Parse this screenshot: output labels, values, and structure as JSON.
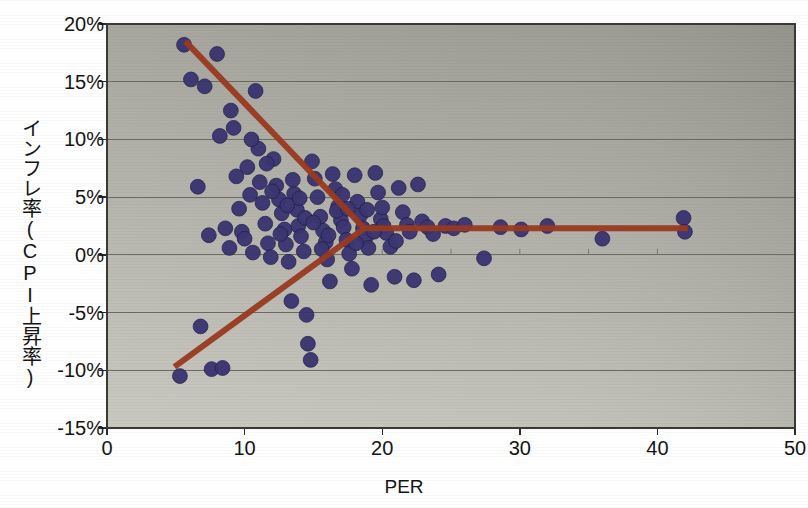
{
  "chart_data": {
    "type": "scatter",
    "title": "",
    "xlabel": "PER",
    "ylabel": "インフレ率(CPI上昇率)",
    "xlim": [
      0,
      50
    ],
    "ylim": [
      -15,
      20
    ],
    "xticks": [
      "0",
      "10",
      "20",
      "30",
      "40",
      "50"
    ],
    "xtick_values": [
      0,
      10,
      20,
      30,
      40,
      50
    ],
    "yticks": [
      "20%",
      "15%",
      "10%",
      "5%",
      "0%",
      "-5%",
      "-10%",
      "-15%"
    ],
    "ytick_values": [
      20,
      15,
      10,
      5,
      0,
      -5,
      -10,
      -15
    ],
    "grid": "horizontal",
    "legend": "none",
    "marker_color": "#3b3572",
    "trendline_color": "#9b3a20",
    "plot_background": "#aeaea6",
    "points": [
      [
        5.3,
        -10.5
      ],
      [
        5.6,
        18.2
      ],
      [
        6.1,
        15.2
      ],
      [
        6.6,
        5.9
      ],
      [
        6.8,
        -6.2
      ],
      [
        7.1,
        14.6
      ],
      [
        7.4,
        1.7
      ],
      [
        7.6,
        -9.9
      ],
      [
        8.0,
        17.4
      ],
      [
        8.2,
        10.3
      ],
      [
        8.4,
        -9.8
      ],
      [
        8.6,
        2.3
      ],
      [
        8.9,
        0.6
      ],
      [
        9.2,
        11.0
      ],
      [
        9.4,
        6.8
      ],
      [
        9.6,
        4.0
      ],
      [
        9.8,
        2.0
      ],
      [
        10.0,
        1.4
      ],
      [
        10.2,
        7.6
      ],
      [
        10.4,
        5.2
      ],
      [
        10.6,
        0.2
      ],
      [
        10.8,
        14.2
      ],
      [
        11.0,
        9.2
      ],
      [
        11.1,
        6.3
      ],
      [
        11.3,
        4.5
      ],
      [
        11.5,
        2.7
      ],
      [
        11.7,
        1.0
      ],
      [
        11.9,
        -0.2
      ],
      [
        12.1,
        8.3
      ],
      [
        12.3,
        6.0
      ],
      [
        12.5,
        4.8
      ],
      [
        12.7,
        3.6
      ],
      [
        12.9,
        2.2
      ],
      [
        13.0,
        0.9
      ],
      [
        13.2,
        -0.6
      ],
      [
        13.4,
        -4.0
      ],
      [
        13.6,
        5.3
      ],
      [
        13.8,
        3.9
      ],
      [
        13.9,
        2.5
      ],
      [
        14.1,
        1.6
      ],
      [
        14.3,
        0.3
      ],
      [
        14.5,
        -5.2
      ],
      [
        14.6,
        -7.7
      ],
      [
        14.8,
        -9.1
      ],
      [
        14.9,
        8.1
      ],
      [
        15.1,
        6.6
      ],
      [
        15.3,
        5.0
      ],
      [
        15.5,
        3.3
      ],
      [
        15.7,
        2.1
      ],
      [
        15.9,
        1.1
      ],
      [
        16.0,
        -0.4
      ],
      [
        16.2,
        -2.3
      ],
      [
        16.4,
        7.0
      ],
      [
        16.6,
        5.7
      ],
      [
        16.8,
        4.2
      ],
      [
        17.0,
        3.0
      ],
      [
        17.2,
        2.4
      ],
      [
        17.4,
        1.3
      ],
      [
        17.6,
        0.1
      ],
      [
        17.8,
        -1.2
      ],
      [
        18.0,
        6.9
      ],
      [
        18.2,
        4.6
      ],
      [
        18.4,
        3.4
      ],
      [
        18.6,
        2.3
      ],
      [
        18.8,
        1.5
      ],
      [
        19.0,
        0.6
      ],
      [
        19.2,
        -2.6
      ],
      [
        19.5,
        7.1
      ],
      [
        19.7,
        5.4
      ],
      [
        19.9,
        3.1
      ],
      [
        20.1,
        2.5
      ],
      [
        20.3,
        1.9
      ],
      [
        20.6,
        0.7
      ],
      [
        20.9,
        -1.9
      ],
      [
        21.2,
        5.8
      ],
      [
        21.5,
        3.7
      ],
      [
        21.8,
        2.6
      ],
      [
        22.0,
        2.0
      ],
      [
        22.3,
        -2.2
      ],
      [
        22.6,
        6.1
      ],
      [
        22.9,
        2.9
      ],
      [
        23.3,
        2.4
      ],
      [
        23.7,
        1.8
      ],
      [
        24.1,
        -1.7
      ],
      [
        24.6,
        2.5
      ],
      [
        25.2,
        2.3
      ],
      [
        26.0,
        2.6
      ],
      [
        27.4,
        -0.3
      ],
      [
        28.6,
        2.4
      ],
      [
        30.1,
        2.2
      ],
      [
        32.0,
        2.5
      ],
      [
        36.0,
        1.4
      ],
      [
        41.9,
        3.2
      ],
      [
        42.0,
        2.0
      ],
      [
        9.0,
        12.5
      ],
      [
        10.5,
        10.0
      ],
      [
        11.6,
        7.9
      ],
      [
        12.0,
        5.5
      ],
      [
        12.6,
        1.8
      ],
      [
        13.1,
        4.3
      ],
      [
        13.5,
        6.5
      ],
      [
        14.0,
        4.9
      ],
      [
        14.4,
        3.2
      ],
      [
        15.0,
        2.8
      ],
      [
        15.6,
        0.5
      ],
      [
        16.1,
        1.7
      ],
      [
        16.7,
        3.8
      ],
      [
        17.1,
        5.2
      ],
      [
        17.5,
        4.0
      ],
      [
        18.1,
        1.0
      ],
      [
        18.9,
        3.9
      ],
      [
        19.4,
        2.0
      ],
      [
        20.0,
        4.1
      ],
      [
        21.0,
        1.2
      ]
    ],
    "trendlines": [
      {
        "name": "declining-branch",
        "x1": 5.7,
        "y1": 18.5,
        "x2": 18.7,
        "y2": 2.3
      },
      {
        "name": "rising-branch",
        "x1": 4.9,
        "y1": -9.7,
        "x2": 18.7,
        "y2": 2.3
      },
      {
        "name": "flat-branch",
        "x1": 18.7,
        "y1": 2.3,
        "x2": 42.2,
        "y2": 2.3
      }
    ]
  }
}
